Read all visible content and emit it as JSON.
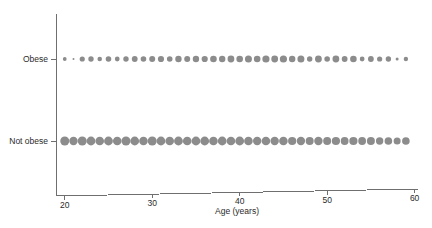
{
  "chart_data": {
    "type": "scatter",
    "title": "",
    "subtitle": "",
    "xlabel": "Age (years)",
    "ylabel": "",
    "xlim": [
      19,
      60.5
    ],
    "xticks": [
      20,
      30,
      40,
      50,
      60
    ],
    "xtick_labels": [
      "20",
      "30",
      "40",
      "50",
      "60"
    ],
    "ycategories": [
      "Obese",
      "Not obese"
    ],
    "grid": false,
    "legend": false,
    "marker_color": "#8c8c8c",
    "axis_color": "#6f6f6f",
    "background_color": "#ffffff",
    "note": "Bubble plot: one marker per integer age from 20 to 59 in each category; marker area encodes count.",
    "x": [
      20,
      21,
      22,
      23,
      24,
      25,
      26,
      27,
      28,
      29,
      30,
      31,
      32,
      33,
      34,
      35,
      36,
      37,
      38,
      39,
      40,
      41,
      42,
      43,
      44,
      45,
      46,
      47,
      48,
      49,
      50,
      51,
      52,
      53,
      54,
      55,
      56,
      57,
      58,
      59
    ],
    "series": [
      {
        "name": "Obese",
        "row": 0,
        "sizes": [
          1.9,
          1.0,
          2.6,
          2.7,
          2.3,
          2.8,
          2.4,
          2.7,
          2.9,
          2.8,
          3.0,
          3.1,
          2.8,
          3.2,
          3.0,
          3.2,
          3.1,
          3.3,
          3.2,
          3.4,
          3.3,
          3.5,
          3.3,
          3.6,
          3.4,
          3.6,
          3.2,
          3.5,
          2.7,
          3.4,
          2.8,
          3.4,
          2.9,
          3.3,
          2.4,
          2.9,
          2.6,
          2.7,
          1.5,
          2.2
        ]
      },
      {
        "name": "Not obese",
        "row": 1,
        "sizes": [
          4.5,
          4.2,
          4.5,
          4.4,
          4.3,
          4.4,
          4.3,
          4.5,
          4.4,
          4.3,
          4.5,
          4.4,
          4.3,
          4.4,
          4.3,
          4.4,
          4.4,
          4.3,
          4.4,
          4.3,
          4.4,
          4.3,
          4.2,
          4.3,
          4.2,
          4.3,
          4.1,
          4.2,
          4.0,
          4.2,
          4.0,
          4.1,
          3.9,
          4.1,
          3.9,
          4.0,
          3.7,
          3.8,
          3.5,
          3.8
        ]
      }
    ]
  },
  "axes": {
    "x_title": "Age (years)",
    "y_labels": [
      "Obese",
      "Not obese"
    ]
  }
}
